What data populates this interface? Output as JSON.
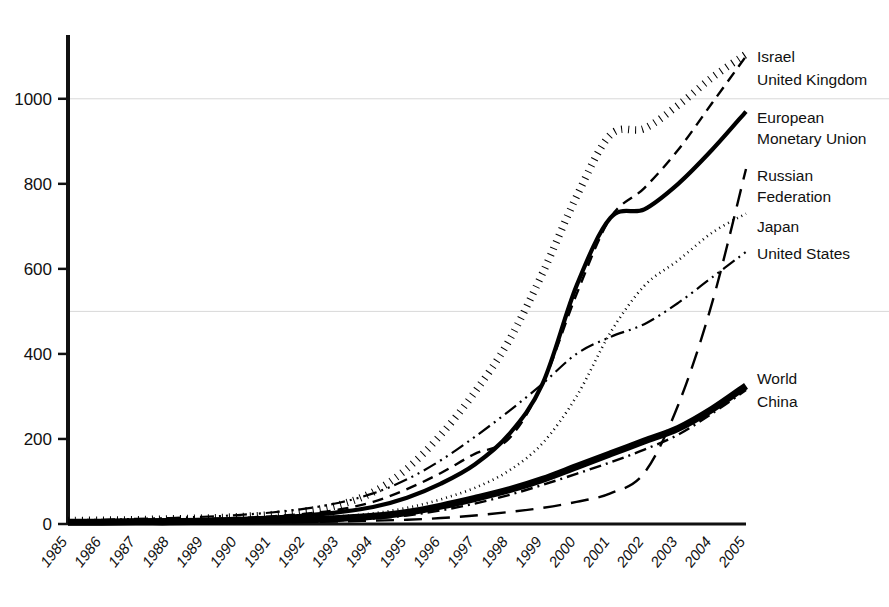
{
  "chart_data": {
    "type": "line",
    "title": "",
    "subtitle": "",
    "xlabel": "",
    "ylabel": "",
    "xlim": [
      1985,
      2005
    ],
    "ylim": [
      0,
      1150
    ],
    "yticks": [
      0,
      200,
      400,
      600,
      800,
      1000
    ],
    "grid": true,
    "grid_values": [
      500,
      1000
    ],
    "legend_position": "right-inline-labels",
    "x": [
      1985,
      1986,
      1987,
      1988,
      1989,
      1990,
      1991,
      1992,
      1993,
      1994,
      1995,
      1996,
      1997,
      1998,
      1999,
      2000,
      2001,
      2002,
      2003,
      2004,
      2005
    ],
    "categories": [
      "1985",
      "1986",
      "1987",
      "1988",
      "1989",
      "1990",
      "1991",
      "1992",
      "1993",
      "1994",
      "1995",
      "1996",
      "1997",
      "1998",
      "1999",
      "2000",
      "2001",
      "2002",
      "2003",
      "2004",
      "2005"
    ],
    "series": [
      {
        "name": "Israel",
        "style": "thick-dotted",
        "values": [
          8,
          9,
          10,
          12,
          14,
          17,
          22,
          30,
          45,
          75,
          130,
          210,
          310,
          430,
          590,
          770,
          915,
          930,
          985,
          1050,
          1105
        ]
      },
      {
        "name": "United Kingdom",
        "style": "dashed",
        "values": [
          7,
          8,
          9,
          10,
          12,
          14,
          18,
          24,
          34,
          52,
          82,
          120,
          165,
          200,
          330,
          540,
          720,
          790,
          880,
          990,
          1100
        ]
      },
      {
        "name": "European Monetary Union",
        "style": "thick-solid",
        "values": [
          6,
          7,
          8,
          9,
          10,
          12,
          15,
          20,
          28,
          40,
          62,
          95,
          140,
          210,
          330,
          560,
          720,
          740,
          800,
          880,
          970
        ]
      },
      {
        "name": "Russian Federation",
        "style": "long-dash",
        "values": [
          1,
          1,
          1,
          2,
          2,
          3,
          4,
          5,
          6,
          8,
          10,
          14,
          20,
          28,
          38,
          52,
          72,
          120,
          280,
          520,
          835
        ]
      },
      {
        "name": "Japan",
        "style": "fine-dotted",
        "values": [
          5,
          6,
          6,
          7,
          8,
          9,
          11,
          14,
          18,
          25,
          38,
          58,
          85,
          125,
          190,
          300,
          450,
          560,
          620,
          685,
          730
        ]
      },
      {
        "name": "United States",
        "style": "dash-dot-dot",
        "values": [
          9,
          10,
          12,
          14,
          17,
          21,
          27,
          36,
          50,
          72,
          105,
          150,
          205,
          265,
          330,
          400,
          440,
          470,
          520,
          580,
          640
        ]
      },
      {
        "name": "World",
        "style": "extra-thick-solid",
        "values": [
          4,
          4,
          5,
          5,
          6,
          7,
          8,
          10,
          13,
          18,
          27,
          42,
          60,
          80,
          105,
          135,
          165,
          195,
          225,
          270,
          325
        ]
      },
      {
        "name": "China",
        "style": "dash-dot",
        "values": [
          2,
          2,
          2,
          3,
          3,
          4,
          5,
          7,
          9,
          13,
          20,
          32,
          48,
          68,
          92,
          118,
          145,
          175,
          210,
          260,
          315
        ]
      }
    ],
    "annotations": [
      {
        "text": "Israel",
        "anchor_year": 2005,
        "anchor_value": 1105
      },
      {
        "text": "United Kingdom",
        "anchor_year": 2005,
        "anchor_value": 1100
      },
      {
        "text": "European",
        "anchor_year": 2005,
        "anchor_value": 985
      },
      {
        "text": "Monetary Union",
        "anchor_year": 2005,
        "anchor_value": 940
      },
      {
        "text": "Russian",
        "anchor_year": 2005,
        "anchor_value": 855
      },
      {
        "text": "Federation",
        "anchor_year": 2005,
        "anchor_value": 810
      },
      {
        "text": "Japan",
        "anchor_year": 2005,
        "anchor_value": 735
      },
      {
        "text": "United States",
        "anchor_year": 2005,
        "anchor_value": 645
      },
      {
        "text": "World",
        "anchor_year": 2005,
        "anchor_value": 350
      },
      {
        "text": "China",
        "anchor_year": 2005,
        "anchor_value": 300
      }
    ]
  },
  "axes": {
    "y_tick_labels": [
      "1000",
      "800",
      "600",
      "400",
      "200",
      "0"
    ],
    "x_tick_labels": [
      "1985",
      "1986",
      "1987",
      "1988",
      "1989",
      "1990",
      "1991",
      "1992",
      "1993",
      "1994",
      "1995",
      "1996",
      "1997",
      "1998",
      "1999",
      "2000",
      "2001",
      "2002",
      "2003",
      "2004",
      "2005"
    ]
  },
  "labels": {
    "israel": "Israel",
    "united_kingdom": "United Kingdom",
    "european": "European",
    "monetary_union": "Monetary Union",
    "russian": "Russian",
    "federation": "Federation",
    "japan": "Japan",
    "united_states": "United States",
    "world": "World",
    "china": "China"
  },
  "colors": {
    "line": "#000000",
    "axis": "#111111",
    "grid": "#d8d8d8",
    "background": "#ffffff"
  }
}
